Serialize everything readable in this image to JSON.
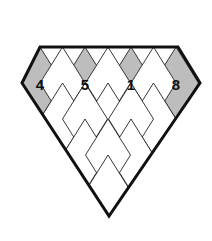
{
  "figure": {
    "title_badge": {
      "name": "circled-number-badge",
      "value": "3",
      "shape": "circle-outline",
      "center_x": 109,
      "center_y": 28,
      "radius": 11
    },
    "outline": {
      "name": "large-diamond-outline",
      "top_left_x": 40,
      "top_right_x": 178,
      "top_y": 47,
      "left_vertex_x": 22,
      "right_vertex_x": 200,
      "side_vertex_y": 83,
      "bottom_vertex_x": 109,
      "bottom_vertex_y": 216,
      "stroke": "#111111",
      "stroke_width": 3
    },
    "lattice": {
      "name": "rhombic-lattice",
      "columns": 4,
      "rows": 4,
      "cell_half_width": 22.5,
      "cell_half_height": 36,
      "stroke": "#222222",
      "stroke_width": 0.9
    },
    "shaded_fill": "#bdbdbd",
    "unshaded_fill": "#ffffff",
    "cells": [
      {
        "name": "diamond-cell-1",
        "label": "4",
        "shaded": true,
        "row": 0,
        "col": 0,
        "center_x": 40,
        "center_y": 83
      },
      {
        "name": "diamond-cell-2",
        "label": "5",
        "shaded": true,
        "row": 0,
        "col": 1,
        "center_x": 85,
        "center_y": 83
      },
      {
        "name": "diamond-cell-3",
        "label": "1",
        "shaded": true,
        "row": 0,
        "col": 2,
        "center_x": 131,
        "center_y": 83
      },
      {
        "name": "diamond-cell-4",
        "label": "8",
        "shaded": true,
        "row": 0,
        "col": 3,
        "center_x": 176,
        "center_y": 83
      }
    ]
  }
}
